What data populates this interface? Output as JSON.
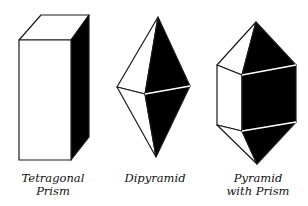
{
  "figures": [
    {
      "name": "tetragonal-prism",
      "label_line1": "Tetragonal",
      "label_line2": "Prism"
    },
    {
      "name": "dipyramid",
      "label_line1": "Dipyramid"
    },
    {
      "name": "pyramid-with-prism",
      "label_line1": "Pyramid",
      "label_line2": "with Prism"
    }
  ],
  "colors": {
    "stroke": "#1a1a1a",
    "dark_face": "#000000",
    "light_face": "#ffffff"
  }
}
